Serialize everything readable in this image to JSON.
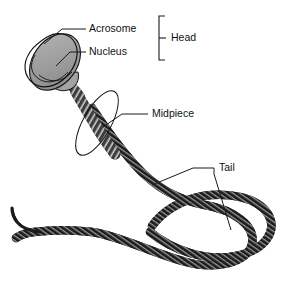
{
  "figure": {
    "type": "anatomical-diagram",
    "background_color": "#ffffff",
    "line_color": "#111111",
    "nucleus_fill": "#9a9a9a",
    "acrosome_fill": "#b8b8b8",
    "midpiece_fill": "#4a4a4a",
    "tail_fill": "#1b1b1b"
  },
  "labels": {
    "acrosome": "Acrosome",
    "nucleus": "Nucleus",
    "head": "Head",
    "midpiece": "Midpiece",
    "tail": "Tail"
  },
  "parts": [
    {
      "name": "acrosome",
      "label": "Acrosome",
      "region": "head-cap"
    },
    {
      "name": "nucleus",
      "label": "Nucleus",
      "region": "head-core"
    },
    {
      "name": "head",
      "label": "Head",
      "region": "bracket-group"
    },
    {
      "name": "midpiece",
      "label": "Midpiece",
      "region": "neck-segment"
    },
    {
      "name": "tail",
      "label": "Tail",
      "region": "flagellum"
    }
  ]
}
